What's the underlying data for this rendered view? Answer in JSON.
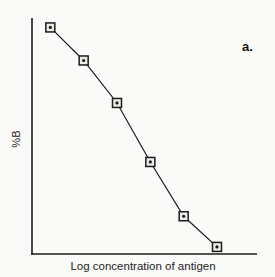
{
  "figure": {
    "panel_label": "a."
  },
  "chart_data": {
    "type": "line",
    "title": "",
    "xlabel": "Log concentration of antigen",
    "ylabel": "%B",
    "x_tick_labels": [],
    "y_tick_labels": [],
    "grid": false,
    "legend": null,
    "xlim": [
      0.45,
      7.2
    ],
    "ylim": [
      0,
      100
    ],
    "x_description": "log concentration of antigen (unlabeled, 6 roughly equally spaced log units)",
    "y_description": "percent bound (%B), unlabeled axis, values estimated from plot height",
    "points": [
      {
        "x": 1,
        "y": 96
      },
      {
        "x": 2,
        "y": 82
      },
      {
        "x": 3,
        "y": 64
      },
      {
        "x": 4,
        "y": 39
      },
      {
        "x": 5,
        "y": 16
      },
      {
        "x": 6,
        "y": 3
      }
    ],
    "marker": "square-with-center-dot",
    "marker_fill": "#edebe7",
    "axis_color": "#1c1c1c",
    "line_color": "#1c1c1c"
  }
}
